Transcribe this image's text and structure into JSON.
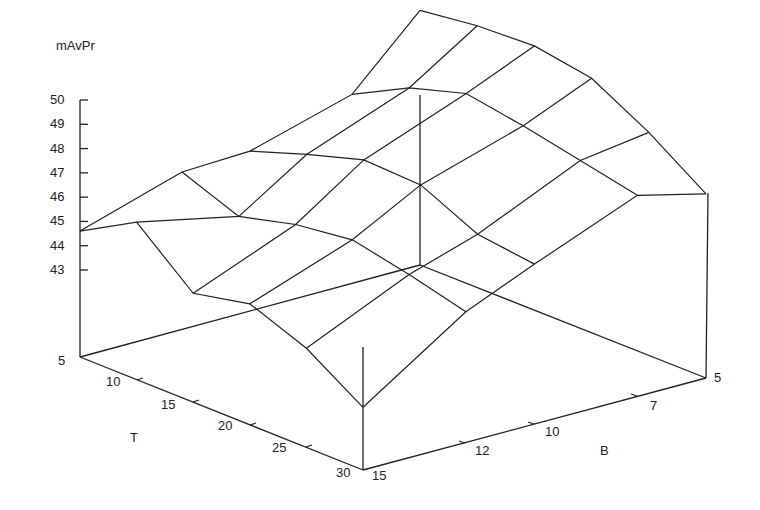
{
  "chart_data": {
    "type": "surface3d",
    "title": "",
    "zlabel": "mAvPr",
    "xlabel": "T",
    "ylabel": "B",
    "z_ticks": [
      "43",
      "44",
      "45",
      "46",
      "47",
      "48",
      "49",
      "50"
    ],
    "t_ticks": [
      "5",
      "10",
      "15",
      "20",
      "25",
      "30"
    ],
    "b_ticks": [
      "5",
      "7",
      "10",
      "12",
      "15"
    ],
    "zlim": [
      43,
      50
    ],
    "T": [
      5,
      10,
      15,
      20,
      25,
      30
    ],
    "B": [
      15,
      12,
      10,
      7,
      5
    ],
    "note": "z values estimated from wireframe; rows indexed by T, columns by B (15,12,10,7,5)",
    "z": [
      [
        44.6,
        45.9,
        46.0,
        47.2,
        49.9
      ],
      [
        45.9,
        45.0,
        46.8,
        48.4,
        50.2
      ],
      [
        43.9,
        45.6,
        47.5,
        49.1,
        50.3
      ],
      [
        44.4,
        45.9,
        47.4,
        48.7,
        49.9
      ],
      [
        43.5,
        45.4,
        46.3,
        48.2,
        48.6
      ],
      [
        42.0,
        44.8,
        46.0,
        47.7,
        47.0
      ]
    ],
    "grid": false,
    "legend": false
  },
  "labels": {
    "zlabel": "mAvPr",
    "t_axis": "T",
    "b_axis": "B",
    "z_ticks": [
      "50",
      "49",
      "48",
      "47",
      "46",
      "45",
      "44",
      "43"
    ],
    "t_ticks": [
      "5",
      "10",
      "15",
      "20",
      "25",
      "30"
    ],
    "b_ticks": [
      "5",
      "7",
      "10",
      "12",
      "15"
    ]
  }
}
